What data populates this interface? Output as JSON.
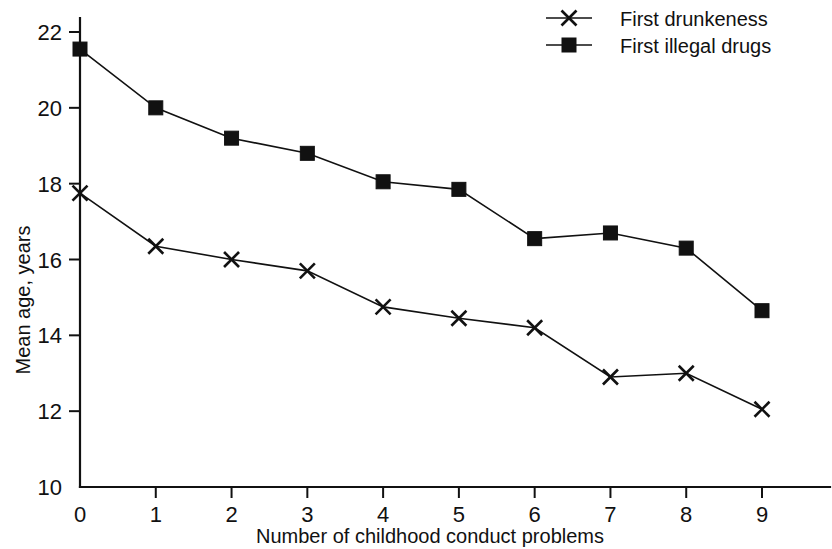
{
  "chart_data": {
    "type": "line",
    "title": "",
    "xlabel": "Number of childhood conduct problems",
    "ylabel": "Mean age, years",
    "x": [
      0,
      1,
      2,
      3,
      4,
      5,
      6,
      7,
      8,
      9
    ],
    "xticklabels": [
      "0",
      "1",
      "2",
      "3",
      "4",
      "5",
      "6",
      "7",
      "8",
      "9"
    ],
    "yticks": [
      10,
      12,
      14,
      16,
      18,
      20,
      22
    ],
    "yticklabels": [
      "10",
      "12",
      "14",
      "16",
      "18",
      "20",
      "22"
    ],
    "xlim": [
      0,
      9
    ],
    "ylim": [
      10,
      22
    ],
    "grid": false,
    "legend_position": "top-right",
    "series": [
      {
        "name": "First drunkeness",
        "marker": "cross",
        "values": [
          17.75,
          16.35,
          16.0,
          15.7,
          14.75,
          14.45,
          14.2,
          12.9,
          13.0,
          12.05
        ]
      },
      {
        "name": "First illegal drugs",
        "marker": "square",
        "values": [
          21.55,
          20.0,
          19.2,
          18.8,
          18.05,
          17.85,
          16.55,
          16.7,
          16.3,
          14.65
        ]
      }
    ]
  },
  "legend": {
    "items": [
      {
        "label": "First drunkeness",
        "marker": "cross"
      },
      {
        "label": "First illegal drugs",
        "marker": "square"
      }
    ]
  },
  "axes": {
    "y_title": "Mean age, years",
    "x_title": "Number of childhood conduct problems"
  },
  "colors": {
    "ink": "#111111",
    "background": "#ffffff"
  }
}
